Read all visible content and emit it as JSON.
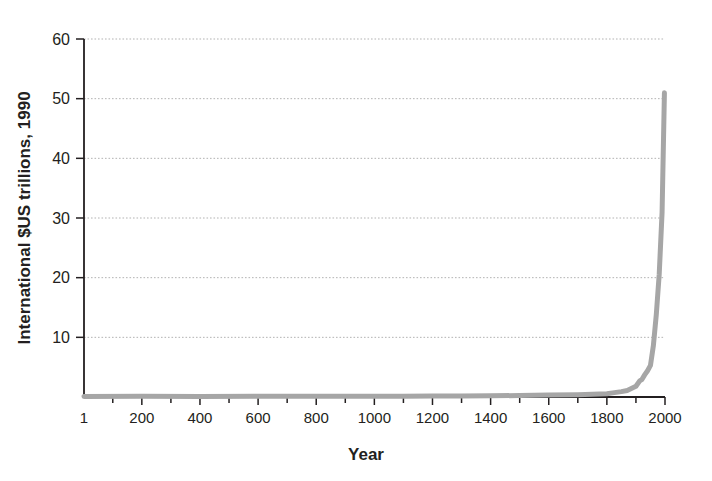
{
  "chart_data": {
    "type": "line",
    "title": "",
    "xlabel": "Year",
    "ylabel": "International $US trillions, 1990",
    "xlim": [
      1,
      2000
    ],
    "ylim": [
      0,
      60
    ],
    "grid": true,
    "grid_axis": "y",
    "legend": "none",
    "line_color": "#a6a6a6",
    "axis_color": "#231f20",
    "grid_color": "#b3b3b3",
    "background": "#ffffff",
    "xticks": [
      1,
      200,
      400,
      600,
      800,
      1000,
      1200,
      1400,
      1600,
      1800,
      2000
    ],
    "xtick_labels": [
      "1",
      "200",
      "400",
      "600",
      "800",
      "1000",
      "1200",
      "1400",
      "1600",
      "1800",
      "2000"
    ],
    "xminor_step": 100,
    "yticks": [
      10,
      20,
      30,
      40,
      50,
      60
    ],
    "ytick_labels": [
      "10",
      "20",
      "30",
      "40",
      "50",
      "60"
    ],
    "series": [
      {
        "name": "World GDP",
        "x": [
          1,
          200,
          400,
          600,
          800,
          1000,
          1100,
          1200,
          1300,
          1400,
          1500,
          1600,
          1700,
          1750,
          1800,
          1820,
          1850,
          1870,
          1900,
          1913,
          1920,
          1930,
          1940,
          1950,
          1960,
          1970,
          1980,
          1990,
          1998
        ],
        "values": [
          0.1,
          0.11,
          0.1,
          0.11,
          0.12,
          0.12,
          0.14,
          0.16,
          0.18,
          0.2,
          0.25,
          0.33,
          0.37,
          0.44,
          0.55,
          0.69,
          0.9,
          1.1,
          1.8,
          2.7,
          2.9,
          3.7,
          4.4,
          5.3,
          8.6,
          13.8,
          20.5,
          31.0,
          51.0
        ]
      }
    ]
  },
  "axis_labels": {
    "x_title": "Year",
    "y_title": "International $US trillions, 1990"
  }
}
